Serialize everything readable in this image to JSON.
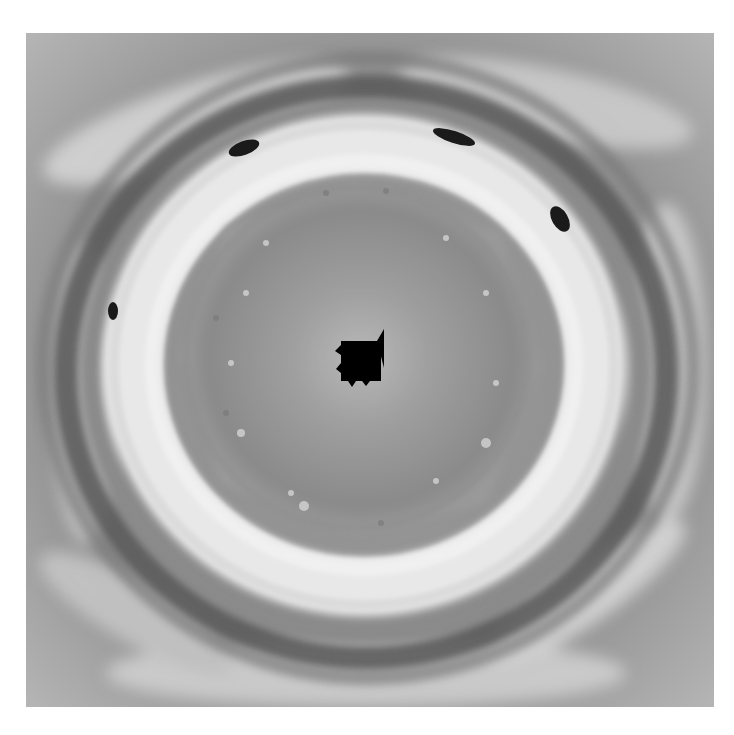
{
  "caption": "",
  "image": {
    "subject": "polar-vortex-hexagon",
    "tone": "grayscale",
    "colors": {
      "background": "#ffffff",
      "outer_band": "#8e8e8e",
      "dark_ring": "#5a5a5a",
      "bright_band": "#e6e6e6",
      "inner_disc": "#9c9c9c",
      "center": "#000000"
    }
  }
}
